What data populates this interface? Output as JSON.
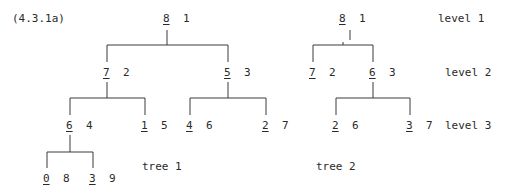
{
  "figure_label": "(4.3.1a)",
  "level_labels": [
    "level 1",
    "level 2",
    "level 3"
  ],
  "tree1": {
    "caption": "tree 1",
    "nodes": [
      {
        "key": "8",
        "idx": "1"
      },
      {
        "key": "7",
        "idx": "2"
      },
      {
        "key": "5",
        "idx": "3"
      },
      {
        "key": "6",
        "idx": "4"
      },
      {
        "key": "1",
        "idx": "5"
      },
      {
        "key": "4",
        "idx": "6"
      },
      {
        "key": "2",
        "idx": "7"
      },
      {
        "key": "0",
        "idx": "8"
      },
      {
        "key": "3",
        "idx": "9"
      }
    ]
  },
  "tree2": {
    "caption": "tree 2",
    "nodes": [
      {
        "key": "8",
        "idx": "1"
      },
      {
        "key": "7",
        "idx": "2"
      },
      {
        "key": "6",
        "idx": "3"
      },
      {
        "key": "2",
        "idx": "6"
      },
      {
        "key": "3",
        "idx": "7"
      }
    ]
  }
}
